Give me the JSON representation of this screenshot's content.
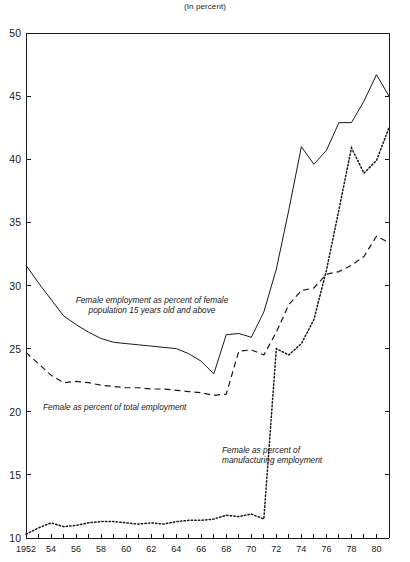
{
  "chart_data": {
    "type": "line",
    "title": "(In percent)",
    "xlabel": "",
    "ylabel": "",
    "xlim": [
      1952,
      1981
    ],
    "ylim": [
      10,
      50
    ],
    "ytick_values": [
      10,
      15,
      20,
      25,
      30,
      35,
      40,
      45,
      50
    ],
    "ytick_labels": [
      "10",
      "15",
      "20",
      "25",
      "30",
      "35",
      "40",
      "45",
      "50"
    ],
    "xtick_values": [
      1952,
      1954,
      1956,
      1958,
      1960,
      1962,
      1964,
      1966,
      1968,
      1970,
      1972,
      1974,
      1976,
      1978,
      1980
    ],
    "xtick_labels": [
      "1952",
      "54",
      "56",
      "58",
      "60",
      "62",
      "64",
      "66",
      "68",
      "70",
      "72",
      "74",
      "76",
      "78",
      "80"
    ],
    "minor_xticks_every": 1,
    "grid": false,
    "legend": "inline-annotations",
    "x": [
      1952,
      1953,
      1954,
      1955,
      1956,
      1957,
      1958,
      1959,
      1960,
      1961,
      1962,
      1963,
      1964,
      1965,
      1966,
      1967,
      1968,
      1969,
      1970,
      1971,
      1972,
      1973,
      1974,
      1975,
      1976,
      1977,
      1978,
      1979,
      1980,
      1981
    ],
    "series": [
      {
        "name": "Female employment as percent of female population 15 years old and above",
        "style": "solid",
        "values": [
          31.6,
          30.2,
          28.9,
          27.6,
          26.9,
          26.3,
          25.8,
          25.5,
          25.4,
          25.3,
          25.2,
          25.1,
          25.0,
          24.6,
          24.0,
          23.0,
          26.1,
          26.2,
          25.9,
          27.9,
          31.3,
          36.0,
          41.0,
          39.6,
          40.7,
          42.9,
          42.9,
          44.6,
          46.7,
          45.0
        ]
      },
      {
        "name": "Female as percent of total employment",
        "style": "dashed",
        "values": [
          24.7,
          23.8,
          22.9,
          22.3,
          22.4,
          22.3,
          22.1,
          22.0,
          21.9,
          21.9,
          21.8,
          21.8,
          21.7,
          21.6,
          21.5,
          21.3,
          21.4,
          24.8,
          24.9,
          24.5,
          26.3,
          28.5,
          29.6,
          29.8,
          30.9,
          31.1,
          31.6,
          32.3,
          33.9,
          33.4
        ]
      },
      {
        "name": "Female as percent of manufacturing employment",
        "style": "dotted",
        "values": [
          10.3,
          10.8,
          11.2,
          10.9,
          11.0,
          11.2,
          11.3,
          11.3,
          11.2,
          11.1,
          11.2,
          11.1,
          11.3,
          11.4,
          11.4,
          11.5,
          11.8,
          11.7,
          11.9,
          11.5,
          25.0,
          24.5,
          25.4,
          27.3,
          31.2,
          36.0,
          40.9,
          38.9,
          39.9,
          42.5
        ],
        "note": "series is discontinuous: a near-vertical jump occurs between 1967 and 1968 in the plotted path"
      }
    ],
    "annotations": [
      {
        "id": "annotation-female-employment",
        "lines": [
          "Female employment as percent of female",
          "population 15 years old and above"
        ],
        "align": "center"
      },
      {
        "id": "annotation-total-employment",
        "lines": [
          "Female as percent of total employment"
        ],
        "align": "left"
      },
      {
        "id": "annotation-manufacturing-employment",
        "lines": [
          "Female as percent of",
          "manufacturing employment"
        ],
        "align": "left"
      }
    ]
  }
}
